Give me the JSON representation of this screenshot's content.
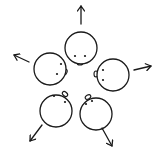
{
  "diagram": {
    "description": "Five heads viewed from above arranged in a ring, each facing inward, with arrows pointing outward",
    "stroke_color": "#1a1a1a",
    "background_color": "#ffffff",
    "heads": [
      {
        "id": "top",
        "cx": 81,
        "cy": 48,
        "r": 16,
        "eyes": [
          [
            75,
            56
          ],
          [
            85,
            56
          ]
        ],
        "nose": {
          "cx": 80,
          "cy": 63,
          "rx": 3,
          "ry": 2,
          "rot": 0
        }
      },
      {
        "id": "left",
        "cx": 50,
        "cy": 69,
        "r": 16,
        "eyes": [
          [
            61,
            64
          ],
          [
            57,
            74
          ]
        ],
        "nose": {
          "cx": 65,
          "cy": 72,
          "rx": 2,
          "ry": 3,
          "rot": 20
        }
      },
      {
        "id": "right",
        "cx": 113,
        "cy": 75,
        "r": 16,
        "eyes": [
          [
            103,
            70
          ],
          [
            103,
            80
          ]
        ],
        "nose": {
          "cx": 96,
          "cy": 74,
          "rx": 2,
          "ry": 3,
          "rot": 0
        }
      },
      {
        "id": "bottom-left",
        "cx": 56,
        "cy": 111,
        "r": 16,
        "eyes": [
          [
            54,
            96
          ],
          [
            65,
            102
          ]
        ],
        "nose": {
          "cx": 65,
          "cy": 94,
          "rx": 3,
          "ry": 2,
          "rot": 40
        }
      },
      {
        "id": "bottom-right",
        "cx": 96,
        "cy": 114,
        "r": 16,
        "eyes": [
          [
            86,
            104
          ],
          [
            92,
            101
          ]
        ],
        "nose": {
          "cx": 88,
          "cy": 97,
          "rx": 3,
          "ry": 2,
          "rot": -30
        }
      }
    ],
    "arrows": [
      {
        "id": "arrow-up",
        "from": [
          81,
          24
        ],
        "to": [
          81,
          6
        ]
      },
      {
        "id": "arrow-left",
        "from": [
          29,
          62
        ],
        "to": [
          14,
          55
        ]
      },
      {
        "id": "arrow-right",
        "from": [
          134,
          70
        ],
        "to": [
          151,
          66
        ]
      },
      {
        "id": "arrow-down-left",
        "from": [
          42,
          125
        ],
        "to": [
          30,
          141
        ]
      },
      {
        "id": "arrow-down-right",
        "from": [
          102,
          128
        ],
        "to": [
          112,
          146
        ]
      }
    ]
  }
}
